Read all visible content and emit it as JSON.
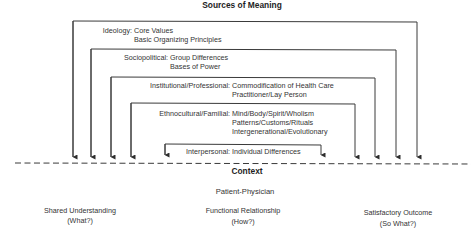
{
  "title": "Sources of Meaning",
  "levels": [
    {
      "label": "Ideology:",
      "values": [
        "Core Values",
        "Basic Organizing Principles"
      ]
    },
    {
      "label": "Sociopolitical:",
      "values": [
        "Group Differences",
        "Bases of Power"
      ]
    },
    {
      "label": "Institutional/Professional:",
      "values": [
        "Commodification of Health Care",
        "Practitioner/Lay Person"
      ]
    },
    {
      "label": "Ethnocultural/Familial:",
      "values": [
        "Mind/Body/Spirit/Wholism",
        "Patterns/Customs/Rituals",
        "Intergenerational/Evolutionary"
      ]
    },
    {
      "label": "Interpersonal:",
      "values": [
        "Individual Differences"
      ]
    }
  ],
  "context": {
    "heading": "Context",
    "subheading": "Patient-Physician",
    "outcomes": [
      {
        "label": "Shared Understanding",
        "question": "(What?)"
      },
      {
        "label": "Functional Relationship",
        "question": "(How?)"
      },
      {
        "label": "Satisfactory Outcome",
        "question": "(So What?)"
      }
    ]
  },
  "colors": {
    "line": "#3a3a3a",
    "text": "#333333"
  }
}
